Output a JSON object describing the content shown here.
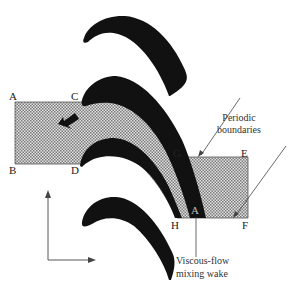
{
  "figure": {
    "type": "turbine cascade computational domain",
    "points": [
      {
        "id": "A",
        "label": "A",
        "x": 13,
        "y": 100
      },
      {
        "id": "B",
        "label": "B",
        "x": 13,
        "y": 174
      },
      {
        "id": "C",
        "label": "C",
        "x": 74,
        "y": 100
      },
      {
        "id": "D",
        "label": "D",
        "x": 74,
        "y": 174
      },
      {
        "id": "G",
        "label": "G",
        "x": 173,
        "y": 158
      },
      {
        "id": "E",
        "label": "E",
        "x": 240,
        "y": 158
      },
      {
        "id": "H",
        "label": "H",
        "x": 171,
        "y": 230
      },
      {
        "id": "F",
        "label": "F",
        "x": 241,
        "y": 230
      },
      {
        "id": "wake-A",
        "label": "A",
        "x": 196,
        "y": 214
      }
    ],
    "annotations": {
      "periodic_line1": "Periodic",
      "periodic_line2": "boundaries",
      "wake_line1": "Viscous-flow",
      "wake_line2": "mixing wake"
    },
    "colors": {
      "blade": "#111111",
      "hatch": "#888888",
      "line": "#444444"
    }
  }
}
